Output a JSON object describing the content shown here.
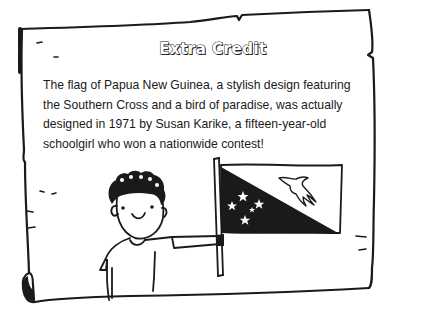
{
  "card": {
    "title": "Extra Credit",
    "body": "The flag of Papua New Guinea, a stylish design featuring the Southern Cross and a bird of paradise, was actually designed in 1971 by Susan Karike, a fifteen-year-old schoolgirl who won a nationwide contest!"
  },
  "illustration": {
    "subject": "child holding flag of Papua New Guinea",
    "flag": {
      "name": "Papua New Guinea",
      "elements": [
        "southern-cross-stars",
        "bird-of-paradise"
      ],
      "star_count": 5
    }
  },
  "colors": {
    "ink": "#1a1a1a",
    "paper": "#ffffff"
  }
}
